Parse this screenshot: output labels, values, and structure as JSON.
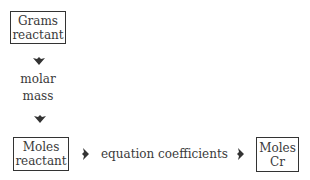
{
  "diagram": {
    "nodes": {
      "grams_reactant": {
        "line1": "Grams",
        "line2": "reactant"
      },
      "moles_reactant": {
        "line1": "Moles",
        "line2": "reactant"
      },
      "moles_cr": {
        "line1": "Moles",
        "line2": "Cr"
      }
    },
    "edges": {
      "molar_mass": {
        "line1": "molar",
        "line2": "mass"
      },
      "equation_coefficients": {
        "label": "equation coefficients"
      }
    },
    "icons": [
      "arrow-down-icon",
      "arrow-down-icon",
      "arrow-right-icon",
      "arrow-right-icon"
    ]
  }
}
